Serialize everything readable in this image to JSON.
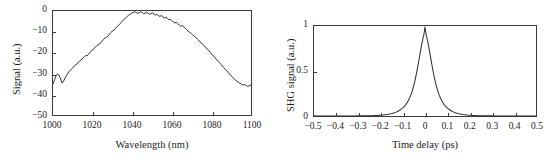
{
  "figure": {
    "background": "#ffffff",
    "line_color": "#2b2b2b",
    "axis_color": "#3a3a3a"
  },
  "chart_data": [
    {
      "id": "spectrum",
      "type": "line",
      "title": "",
      "xlabel": "Wavelength (nm)",
      "ylabel": "Signal (a.u.)",
      "xlim": [
        1000,
        1100
      ],
      "ylim": [
        -50,
        0
      ],
      "xticks": [
        1000,
        1020,
        1040,
        1060,
        1080,
        1100
      ],
      "xticklabels": [
        "1000",
        "1020",
        "1040",
        "1060",
        "1080",
        "1100"
      ],
      "yticks": [
        0,
        -10,
        -20,
        -30,
        -40,
        -50
      ],
      "yticklabels": [
        "0",
        "−10",
        "−20",
        "−30",
        "−40",
        "−50"
      ],
      "grid": false,
      "legend": false,
      "x": [
        1000.0,
        1000.8,
        1001.5,
        1002.2,
        1003.0,
        1003.8,
        1004.5,
        1005.2,
        1006.0,
        1006.8,
        1007.5,
        1008.2,
        1009.0,
        1009.8,
        1010.5,
        1011.2,
        1012.0,
        1012.8,
        1013.5,
        1014.2,
        1015.0,
        1015.8,
        1016.5,
        1017.2,
        1018.0,
        1018.8,
        1019.5,
        1020.2,
        1021.0,
        1021.8,
        1022.5,
        1023.2,
        1024.0,
        1024.8,
        1025.5,
        1026.2,
        1027.0,
        1027.8,
        1028.5,
        1029.2,
        1030.0,
        1030.8,
        1031.5,
        1032.2,
        1033.0,
        1033.8,
        1034.5,
        1035.2,
        1036.0,
        1036.8,
        1037.5,
        1038.2,
        1039.0,
        1039.8,
        1040.5,
        1041.2,
        1042.0,
        1042.8,
        1043.5,
        1044.2,
        1045.0,
        1045.8,
        1046.5,
        1047.2,
        1048.0,
        1048.8,
        1049.5,
        1050.2,
        1051.0,
        1051.8,
        1052.5,
        1053.2,
        1054.0,
        1054.8,
        1055.5,
        1056.2,
        1057.0,
        1057.8,
        1058.5,
        1059.2,
        1060.0,
        1060.8,
        1061.5,
        1062.2,
        1063.0,
        1063.8,
        1064.5,
        1065.2,
        1066.0,
        1066.8,
        1067.5,
        1068.2,
        1069.0,
        1069.8,
        1070.5,
        1071.2,
        1072.0,
        1072.8,
        1073.5,
        1074.2,
        1075.0,
        1075.8,
        1076.5,
        1077.2,
        1078.0,
        1078.8,
        1079.5,
        1080.2,
        1081.0,
        1081.8,
        1082.5,
        1083.2,
        1084.0,
        1084.8,
        1085.5,
        1086.2,
        1087.0,
        1087.8,
        1088.5,
        1089.2,
        1090.0,
        1090.8,
        1091.5,
        1092.2,
        1093.0,
        1093.8,
        1094.5,
        1095.2,
        1096.0,
        1096.8,
        1097.5,
        1098.2,
        1099.0,
        1099.5,
        1100.0
      ],
      "y": [
        -35.0,
        -33.0,
        -31.2,
        -30.3,
        -30.8,
        -32.6,
        -34.6,
        -34.0,
        -32.4,
        -31.0,
        -30.0,
        -29.0,
        -28.2,
        -27.6,
        -26.7,
        -26.0,
        -25.6,
        -24.6,
        -24.0,
        -23.6,
        -22.6,
        -22.0,
        -21.4,
        -21.6,
        -20.8,
        -19.8,
        -19.0,
        -18.6,
        -17.6,
        -17.0,
        -16.4,
        -16.2,
        -15.2,
        -14.6,
        -13.6,
        -13.0,
        -12.6,
        -12.0,
        -11.2,
        -10.4,
        -9.6,
        -9.2,
        -8.4,
        -7.6,
        -7.0,
        -6.2,
        -5.4,
        -4.6,
        -4.0,
        -3.2,
        -2.6,
        -2.0,
        -1.6,
        -1.0,
        -0.7,
        -0.4,
        -0.6,
        -1.2,
        -0.8,
        -0.4,
        -0.7,
        -1.4,
        -1.0,
        -0.6,
        -1.0,
        -1.6,
        -1.2,
        -0.9,
        -1.4,
        -2.0,
        -1.6,
        -2.2,
        -2.6,
        -2.2,
        -2.8,
        -3.4,
        -3.0,
        -3.6,
        -4.2,
        -4.0,
        -4.6,
        -5.2,
        -5.8,
        -5.4,
        -6.0,
        -6.8,
        -7.4,
        -7.0,
        -7.6,
        -8.4,
        -9.0,
        -9.6,
        -10.2,
        -10.8,
        -11.4,
        -12.0,
        -12.6,
        -13.4,
        -14.0,
        -14.8,
        -15.4,
        -16.2,
        -16.8,
        -17.6,
        -18.4,
        -19.2,
        -20.0,
        -20.8,
        -21.6,
        -22.4,
        -23.2,
        -24.0,
        -24.8,
        -25.6,
        -26.4,
        -27.2,
        -28.0,
        -28.8,
        -29.6,
        -30.4,
        -31.2,
        -32.0,
        -32.6,
        -33.2,
        -33.8,
        -34.4,
        -34.8,
        -35.2,
        -35.6,
        -35.4,
        -35.8,
        -36.2,
        -36.0,
        -35.7,
        -35.5
      ]
    },
    {
      "id": "autocorrelation",
      "type": "line",
      "title": "",
      "xlabel": "Time delay (ps)",
      "ylabel": "SHG signal (a.u.)",
      "xlim": [
        -0.5,
        0.5
      ],
      "ylim": [
        0,
        1
      ],
      "xticks": [
        -0.5,
        -0.4,
        -0.3,
        -0.2,
        -0.1,
        0,
        0.1,
        0.2,
        0.3,
        0.4,
        0.5
      ],
      "xticklabels": [
        "−0.5",
        "−0.4",
        "−0.3",
        "−0.2",
        "−0.1",
        "0",
        "0.1",
        "0.2",
        "0.3",
        "0.4",
        "0.5"
      ],
      "yticks": [
        0,
        0.5,
        1
      ],
      "yticklabels": [
        "0",
        "0.5",
        "1"
      ],
      "grid": false,
      "legend": false,
      "peak_center": 0,
      "peak_value": 1,
      "fwhm": 0.075,
      "x": [
        -0.5,
        -0.48,
        -0.46,
        -0.44,
        -0.42,
        -0.4,
        -0.38,
        -0.36,
        -0.34,
        -0.32,
        -0.3,
        -0.28,
        -0.26,
        -0.24,
        -0.22,
        -0.2,
        -0.19,
        -0.18,
        -0.17,
        -0.16,
        -0.15,
        -0.14,
        -0.13,
        -0.12,
        -0.11,
        -0.1,
        -0.095,
        -0.09,
        -0.085,
        -0.08,
        -0.075,
        -0.07,
        -0.065,
        -0.06,
        -0.055,
        -0.05,
        -0.045,
        -0.04,
        -0.035,
        -0.03,
        -0.025,
        -0.02,
        -0.015,
        -0.01,
        -0.005,
        0.0,
        0.005,
        0.01,
        0.015,
        0.02,
        0.025,
        0.03,
        0.035,
        0.04,
        0.045,
        0.05,
        0.055,
        0.06,
        0.065,
        0.07,
        0.075,
        0.08,
        0.085,
        0.09,
        0.095,
        0.1,
        0.11,
        0.12,
        0.13,
        0.14,
        0.15,
        0.16,
        0.17,
        0.18,
        0.19,
        0.2,
        0.22,
        0.24,
        0.26,
        0.28,
        0.3,
        0.32,
        0.34,
        0.36,
        0.38,
        0.4,
        0.42,
        0.44,
        0.46,
        0.48,
        0.5
      ],
      "y": [
        0.0,
        0.0,
        0.0,
        0.0,
        0.0,
        0.0,
        0.0,
        0.001,
        0.001,
        0.001,
        0.002,
        0.002,
        0.003,
        0.004,
        0.006,
        0.009,
        0.011,
        0.014,
        0.017,
        0.021,
        0.027,
        0.034,
        0.043,
        0.055,
        0.07,
        0.09,
        0.102,
        0.116,
        0.132,
        0.15,
        0.172,
        0.197,
        0.226,
        0.26,
        0.299,
        0.344,
        0.395,
        0.453,
        0.516,
        0.584,
        0.655,
        0.726,
        0.794,
        0.855,
        0.905,
        0.99,
        0.905,
        0.855,
        0.794,
        0.726,
        0.655,
        0.584,
        0.516,
        0.453,
        0.395,
        0.344,
        0.299,
        0.26,
        0.226,
        0.197,
        0.172,
        0.15,
        0.132,
        0.116,
        0.102,
        0.09,
        0.07,
        0.055,
        0.043,
        0.034,
        0.027,
        0.021,
        0.017,
        0.014,
        0.011,
        0.009,
        0.006,
        0.004,
        0.003,
        0.002,
        0.002,
        0.001,
        0.001,
        0.001,
        0.0,
        0.0,
        0.0,
        0.0,
        0.0,
        0.0,
        0.0
      ]
    }
  ]
}
